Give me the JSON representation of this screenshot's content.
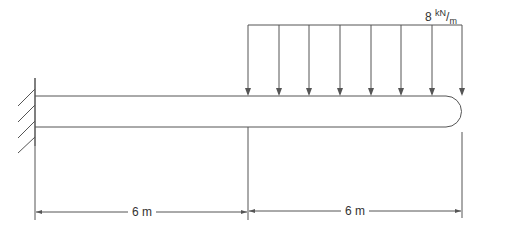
{
  "diagram": {
    "type": "cantilever-beam",
    "support": "fixed-wall-left",
    "load": {
      "value": "8",
      "unit_num": "kN",
      "unit_den": "m",
      "type": "uniformly-distributed",
      "arrow_count": 8
    },
    "dimensions": [
      {
        "label": "6 m"
      },
      {
        "label": "6 m"
      }
    ],
    "colors": {
      "line": "#555555",
      "text": "#333333"
    }
  }
}
